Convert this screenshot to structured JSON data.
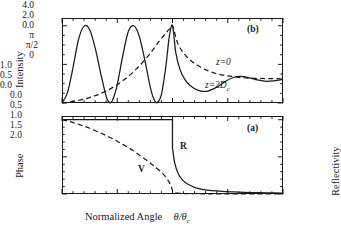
{
  "figure": {
    "xaxis": {
      "label_main": "Normalized Angle",
      "label_symbol": "θ/θ",
      "label_symbol_sub": "c",
      "ticks": [
        "0.0",
        "0.5",
        "1.0",
        "1.5",
        "2.0"
      ]
    },
    "panel_b": {
      "tag": "(b)",
      "ylabel": "Intensity",
      "yticks": [
        "4.0",
        "2.0",
        "0.0"
      ],
      "curve_label_dashed": "z=0",
      "curve_label_solid_pre": "z=2D",
      "curve_label_solid_sub": "c"
    },
    "panel_a": {
      "tag": "(a)",
      "ylabel_left": "Phase",
      "ylabel_right": "Reflectivity",
      "yticks_left": [
        "π",
        "π/2",
        "0"
      ],
      "yticks_right": [
        "1.0",
        "0.5",
        "0.0"
      ],
      "curve_label_solid": "R",
      "curve_label_dashed": "V"
    }
  },
  "chart_data": {
    "type": "line",
    "title": "",
    "panels": [
      {
        "id": "b",
        "tag": "(b)",
        "ylabel": "Intensity",
        "ylim": [
          0,
          4.4
        ],
        "yticks": [
          0.0,
          2.0,
          4.0
        ],
        "xlim": [
          0.0,
          2.0
        ],
        "xticks": [
          0.0,
          0.5,
          1.0,
          1.5,
          2.0
        ],
        "grid": false,
        "legend": "inline-annotation",
        "series": [
          {
            "name": "z=2Dc",
            "style": "solid",
            "description": "Standing-wave intensity with three interference maxima of amplitude 4.0 below the critical angle, sharp peak at theta/theta_c = 1.0, then damped oscillation decaying toward ~1.2",
            "x": [
              0.0,
              0.05,
              0.1,
              0.15,
              0.2,
              0.25,
              0.3,
              0.35,
              0.4,
              0.43,
              0.46,
              0.5,
              0.55,
              0.6,
              0.65,
              0.7,
              0.75,
              0.8,
              0.83,
              0.86,
              0.9,
              0.94,
              0.97,
              1.0,
              1.03,
              1.07,
              1.12,
              1.18,
              1.25,
              1.32,
              1.4,
              1.48,
              1.55,
              1.62,
              1.7,
              1.78,
              1.85,
              1.92,
              2.0
            ],
            "y": [
              0.0,
              0.55,
              1.85,
              3.3,
              3.98,
              3.8,
              2.85,
              1.55,
              0.35,
              0.02,
              0.18,
              0.95,
              2.45,
              3.7,
              4.0,
              3.45,
              2.2,
              0.8,
              0.22,
              0.02,
              0.45,
              1.9,
              3.4,
              4.0,
              2.6,
              1.7,
              1.15,
              0.82,
              0.63,
              0.62,
              0.82,
              1.12,
              1.32,
              1.38,
              1.3,
              1.18,
              1.12,
              1.15,
              1.22
            ]
          },
          {
            "name": "z=0",
            "style": "dashed",
            "description": "Surface intensity rising monotonically from 0 to the critical-angle maximum of 4.0, then decaying smoothly toward ~1.25",
            "x": [
              0.0,
              0.1,
              0.2,
              0.3,
              0.4,
              0.5,
              0.6,
              0.7,
              0.8,
              0.88,
              0.94,
              0.97,
              1.0,
              1.05,
              1.12,
              1.2,
              1.3,
              1.4,
              1.5,
              1.6,
              1.7,
              1.8,
              1.9,
              2.0
            ],
            "y": [
              0.0,
              0.08,
              0.2,
              0.38,
              0.62,
              0.95,
              1.38,
              1.92,
              2.58,
              3.2,
              3.62,
              3.82,
              4.0,
              3.05,
              2.45,
              2.05,
              1.72,
              1.52,
              1.4,
              1.33,
              1.29,
              1.27,
              1.26,
              1.25
            ]
          }
        ]
      },
      {
        "id": "a",
        "tag": "(a)",
        "ylabel_left": "Phase",
        "ylabel_right": "Reflectivity",
        "ylim_left": [
          0,
          3.3
        ],
        "yticks_left": [
          0,
          1.5708,
          3.1416
        ],
        "ytick_labels_left": [
          "0",
          "π/2",
          "π"
        ],
        "ylim_right": [
          0,
          1.05
        ],
        "yticks_right": [
          0.0,
          0.5,
          1.0
        ],
        "xlim": [
          0.0,
          2.0
        ],
        "xticks": [
          0.0,
          0.5,
          1.0,
          1.5,
          2.0
        ],
        "grid": false,
        "series": [
          {
            "name": "R",
            "style": "solid",
            "axis": "right",
            "description": "Reflectivity equal to 1.0 for theta below the critical angle, dropping abruptly at theta/theta_c = 1.0 and falling toward 0",
            "x": [
              0.0,
              0.2,
              0.4,
              0.6,
              0.8,
              0.95,
              1.0,
              1.0,
              1.02,
              1.05,
              1.09,
              1.14,
              1.2,
              1.28,
              1.36,
              1.45,
              1.55,
              1.65,
              1.75,
              1.85,
              2.0
            ],
            "y": [
              1.0,
              1.0,
              1.0,
              1.0,
              1.0,
              1.0,
              1.0,
              0.62,
              0.42,
              0.28,
              0.19,
              0.13,
              0.09,
              0.06,
              0.045,
              0.035,
              0.028,
              0.022,
              0.018,
              0.015,
              0.012
            ]
          },
          {
            "name": "V",
            "style": "dashed",
            "axis": "left",
            "description": "Phase of the reflected wave decreasing from π at normal incidence to 0 just above the critical angle",
            "x": [
              0.0,
              0.08,
              0.16,
              0.25,
              0.35,
              0.45,
              0.55,
              0.64,
              0.72,
              0.79,
              0.85,
              0.9,
              0.94,
              0.97,
              0.99,
              1.0,
              1.02,
              1.1,
              1.3,
              1.6,
              2.0
            ],
            "y": [
              3.1416,
              3.05,
              2.93,
              2.78,
              2.58,
              2.36,
              2.1,
              1.85,
              1.58,
              1.34,
              1.12,
              0.92,
              0.72,
              0.5,
              0.3,
              0.14,
              0.05,
              0.02,
              0.01,
              0.01,
              0.01
            ]
          }
        ]
      }
    ]
  }
}
